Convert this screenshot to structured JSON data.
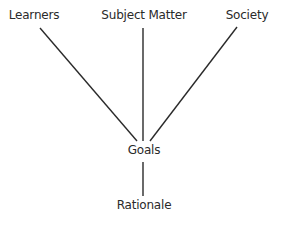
{
  "diagram": {
    "nodes": {
      "learners": "Learners",
      "subject_matter": "Subject Matter",
      "society": "Society",
      "goals": "Goals",
      "rationale": "Rationale"
    },
    "edges": [
      {
        "from": "Learners",
        "to": "Goals"
      },
      {
        "from": "Subject Matter",
        "to": "Goals"
      },
      {
        "from": "Society",
        "to": "Goals"
      },
      {
        "from": "Goals",
        "to": "Rationale"
      }
    ],
    "line_color": "#2a2a2a"
  }
}
